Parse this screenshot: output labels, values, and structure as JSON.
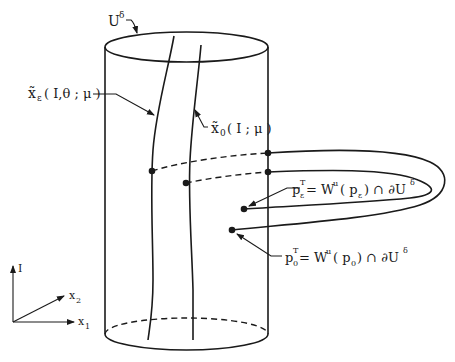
{
  "figure": {
    "labels": {
      "neighborhood": "U",
      "neighborhood_sup": "δ",
      "curve_eps_main": "x̃",
      "curve_eps_sub": "ε",
      "curve_eps_args": "( I,θ ; μ )",
      "curve_0_main": "x̃",
      "curve_0_sub": "0",
      "curve_0_args": "( I ; μ )",
      "pT_eps_base": "p",
      "pT_eps_sub": "ε",
      "pT_eps_sup": "T",
      "pT_eps_rhs_a": " = W",
      "pT_eps_rhs_sup": "u",
      "pT_eps_rhs_b": "( p",
      "pT_eps_rhs_sub": "ε",
      "pT_eps_rhs_c": ") ∩ ∂U",
      "pT_eps_rhs_sup2": "δ",
      "pT_0_base": "p",
      "pT_0_sub": "0",
      "pT_0_sup": "T",
      "pT_0_rhs_a": " = W",
      "pT_0_rhs_sup": "u",
      "pT_0_rhs_b": "( p",
      "pT_0_rhs_sub": "0",
      "pT_0_rhs_c": ") ∩ ∂U",
      "pT_0_rhs_sup2": "δ"
    },
    "axes": {
      "vertical": "I",
      "diagonal": "x",
      "diagonal_sub": "2",
      "horizontal": "x",
      "horizontal_sub": "1"
    },
    "colors": {
      "ink": "#1a1a1a",
      "background": "#ffffff"
    }
  }
}
